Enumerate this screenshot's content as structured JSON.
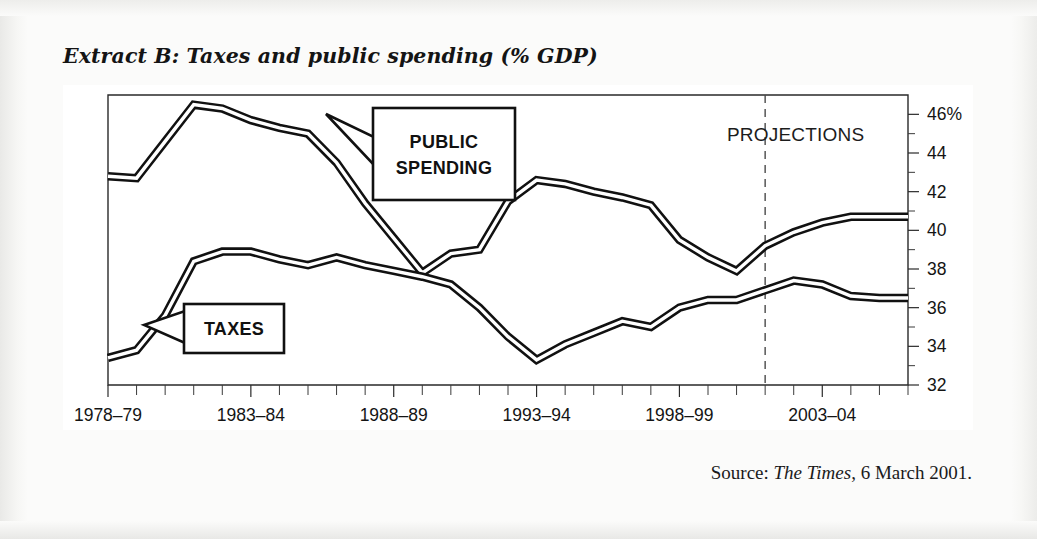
{
  "title": "Extract B: Taxes and public spending (% GDP)",
  "source": {
    "prefix": "Source: ",
    "publication": "The Times",
    "suffix": ", 6 March 2001."
  },
  "annotations": {
    "public_spending_label_line1": "PUBLIC",
    "public_spending_label_line2": "SPENDING",
    "taxes_label": "TAXES",
    "projections_label": "PROJECTIONS"
  },
  "colors": {
    "line": "#111111",
    "line_inner": "#ffffff",
    "axis": "#2a2a2a",
    "projection_divider": "#4a4a4a",
    "paper": "#fbfbfa",
    "plot_background": "#ffffff"
  },
  "chart_data": {
    "type": "line",
    "title": "Extract B: Taxes and public spending (% GDP)",
    "xlabel": "",
    "ylabel": "% GDP",
    "ylim": [
      32,
      47
    ],
    "xlim": [
      0,
      28
    ],
    "grid": false,
    "legend": "annotated-callouts",
    "y_ticks_major": [
      32,
      34,
      36,
      38,
      40,
      42,
      44,
      46
    ],
    "y_tick_labels": [
      "32",
      "34",
      "36",
      "38",
      "40",
      "42",
      "44",
      "46%"
    ],
    "y_ticks_minor": [
      33,
      35,
      37,
      39,
      41,
      43,
      45
    ],
    "x_tick_labels": [
      "1978–79",
      "1983–84",
      "1988–89",
      "1993–94",
      "1998–99",
      "2003–04"
    ],
    "x_tick_label_indices": [
      0,
      5,
      10,
      15,
      20,
      25
    ],
    "x_minor_tick_count": 29,
    "projection_start_index": 23,
    "projection_note": "Values at and after 2001–02 are projections",
    "x_categories": [
      "1978–79",
      "1979–80",
      "1980–81",
      "1981–82",
      "1982–83",
      "1983–84",
      "1984–85",
      "1985–86",
      "1986–87",
      "1987–88",
      "1988–89",
      "1989–90",
      "1990–91",
      "1991–92",
      "1992–93",
      "1993–94",
      "1994–95",
      "1995–96",
      "1996–97",
      "1997–98",
      "1998–99",
      "1999–00",
      "2000–01",
      "2001–02",
      "2002–03",
      "2003–04",
      "2004–05",
      "2005–06",
      "2006–07"
    ],
    "series": [
      {
        "name": "PUBLIC SPENDING",
        "values": [
          42.8,
          42.7,
          44.6,
          46.5,
          46.3,
          45.7,
          45.3,
          45.0,
          43.5,
          41.4,
          39.6,
          37.8,
          38.8,
          39.0,
          41.5,
          42.6,
          42.4,
          42.0,
          41.7,
          41.3,
          39.5,
          38.6,
          37.9,
          39.2,
          39.9,
          40.4,
          40.7,
          40.7,
          40.7
        ]
      },
      {
        "name": "TAXES",
        "values": [
          33.4,
          33.8,
          35.6,
          38.4,
          38.9,
          38.9,
          38.5,
          38.2,
          38.6,
          38.2,
          37.9,
          37.6,
          37.2,
          36.0,
          34.5,
          33.3,
          34.1,
          34.7,
          35.3,
          35.0,
          36.0,
          36.4,
          36.4,
          36.9,
          37.4,
          37.2,
          36.6,
          36.5,
          36.5
        ]
      }
    ]
  }
}
